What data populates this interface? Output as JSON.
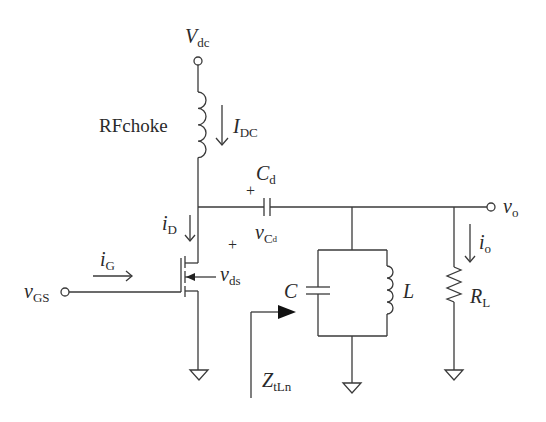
{
  "diagram": {
    "type": "circuit-schematic",
    "labels": {
      "vdc": {
        "main": "V",
        "sub": "dc"
      },
      "rfchoke": "RFchoke",
      "idc": {
        "main": "I",
        "sub": "DC"
      },
      "cd": {
        "main": "C",
        "sub": "d"
      },
      "vcd": {
        "main": "v",
        "sub": "C",
        "subsub": "d"
      },
      "id": {
        "main": "i",
        "sub": "D"
      },
      "ig": {
        "main": "i",
        "sub": "G"
      },
      "vgs": {
        "main": "v",
        "sub": "GS"
      },
      "vds": {
        "main": "v",
        "sub": "ds"
      },
      "c": "C",
      "l": "L",
      "rl": {
        "main": "R",
        "sub": "L"
      },
      "vo": {
        "main": "v",
        "sub": "o"
      },
      "io": {
        "main": "i",
        "sub": "o"
      },
      "ztln": {
        "main": "Z",
        "sub": "tLn"
      },
      "plus_cd": "+",
      "plus_vds": "+"
    },
    "components": [
      {
        "id": "Vdc",
        "kind": "terminal"
      },
      {
        "id": "RFchoke",
        "kind": "inductor"
      },
      {
        "id": "M1",
        "kind": "nmos"
      },
      {
        "id": "Cd",
        "kind": "capacitor"
      },
      {
        "id": "C",
        "kind": "capacitor"
      },
      {
        "id": "L",
        "kind": "inductor"
      },
      {
        "id": "RL",
        "kind": "resistor"
      },
      {
        "id": "vGS",
        "kind": "terminal"
      },
      {
        "id": "vo",
        "kind": "terminal"
      },
      {
        "id": "GND1",
        "kind": "ground"
      },
      {
        "id": "GND2",
        "kind": "ground"
      },
      {
        "id": "GND3",
        "kind": "ground"
      }
    ],
    "colors": {
      "stroke": "#3a3a3a",
      "text": "#2a2a2a",
      "background": "#ffffff"
    }
  }
}
